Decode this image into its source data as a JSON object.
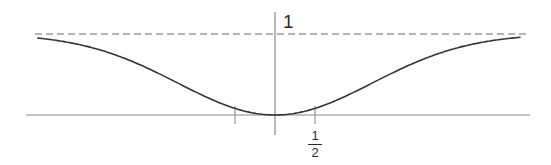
{
  "diagram": {
    "type": "function-plot",
    "colors": {
      "curve": "#333333",
      "axes": "#888888",
      "asymptote": "#999999",
      "background": "#ffffff"
    },
    "labels": {
      "asymptote_value": "1",
      "tick_numerator": "1",
      "tick_denominator": "2"
    },
    "ticks": [
      -0.5,
      0.5
    ],
    "asymptote_y": 1,
    "minimum": {
      "x": 0,
      "y": 0
    }
  },
  "chart_data": {
    "type": "line",
    "title": "",
    "xlabel": "",
    "ylabel": "",
    "x_ticks": [
      {
        "value": -0.5,
        "label": ""
      },
      {
        "value": 0.5,
        "label": "1/2"
      }
    ],
    "y_ticks": [
      {
        "value": 1,
        "label": "1"
      }
    ],
    "asymptote": {
      "y": 1,
      "style": "dashed"
    },
    "xlim": [
      -3.0,
      3.1
    ],
    "ylim": [
      0,
      1
    ],
    "series": [
      {
        "name": "f(x)",
        "x": [
          -2.96,
          -2.5,
          -2.0,
          -1.71,
          -1.5,
          -1.0,
          -0.5,
          0,
          0.5,
          1.0,
          1.5,
          1.71,
          2.0,
          2.5,
          3.08
        ],
        "y": [
          0.93,
          0.89,
          0.76,
          0.64,
          0.55,
          0.3,
          0.09,
          0.0,
          0.09,
          0.3,
          0.55,
          0.64,
          0.76,
          0.89,
          0.91
        ]
      }
    ],
    "grid": false,
    "legend": null
  }
}
